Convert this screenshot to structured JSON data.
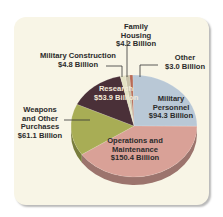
{
  "chart_data": {
    "type": "pie",
    "title": "",
    "style": "3d",
    "unit": "Billion USD",
    "slices": [
      {
        "label": "Family Housing",
        "value": 4.2,
        "display": "$4.2 Billion",
        "color": "#c9c2a8"
      },
      {
        "label": "Other",
        "value": 3.0,
        "display": "$3.0 Billion",
        "color": "#b86a55"
      },
      {
        "label": "Military Personnel",
        "value": 94.3,
        "display": "$94.3 Billion",
        "color": "#b9c8d6"
      },
      {
        "label": "Operations and Maintenance",
        "value": 150.4,
        "display": "$150.4 Billion",
        "color": "#d9a197"
      },
      {
        "label": "Weapons and Other Purchases",
        "value": 61.1,
        "display": "$61.1 Billion",
        "color": "#a8ad55"
      },
      {
        "label": "Research",
        "value": 53.9,
        "display": "$53.9 Billion",
        "color": "#4a3038"
      },
      {
        "label": "Military Construction",
        "value": 4.8,
        "display": "$4.8 Billion",
        "color": "#e4e2c4"
      }
    ],
    "legend": "none (direct labels with leader lines)"
  },
  "labels": {
    "family_housing": {
      "line1": "Family",
      "line2": "Housing",
      "line3": "$4.2 Billion"
    },
    "other": {
      "line1": "Other",
      "line2": "$3.0 Billion"
    },
    "military_construction": {
      "line1": "Military Construction",
      "line2": "$4.8 Billion"
    },
    "research": {
      "line1": "Research",
      "line2": "$53.9 Billion"
    },
    "military_personnel": {
      "line1": "Military",
      "line2": "Personnel",
      "line3": "$94.3 Billion"
    },
    "weapons": {
      "line1": "Weapons",
      "line2": "and Other",
      "line3": "Purchases",
      "line4": "$61.1 Billion"
    },
    "operations": {
      "line1": "Operations and",
      "line2": "Maintenance",
      "line3": "$150.4 Billion"
    }
  }
}
